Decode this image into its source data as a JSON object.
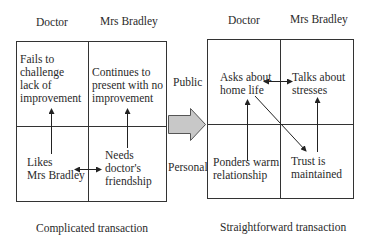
{
  "left_panel": {
    "headers": {
      "doctor": "Doctor",
      "patient": "Mrs Bradley"
    },
    "cells": {
      "public_doctor": [
        "Fails to",
        "challenge",
        "lack of",
        "improvement"
      ],
      "public_patient": [
        "Continues to",
        "present with no",
        "improvement"
      ],
      "personal_doctor": [
        "Likes",
        "Mrs Bradley"
      ],
      "personal_patient": [
        "Needs",
        "doctor's",
        "friendship"
      ]
    },
    "caption": "Complicated transaction"
  },
  "row_labels": {
    "public": "Public",
    "personal": "Personal"
  },
  "right_panel": {
    "headers": {
      "doctor": "Doctor",
      "patient": "Mrs Bradley"
    },
    "cells": {
      "public_doctor": [
        "Asks about",
        "home life"
      ],
      "public_patient": [
        "Talks about",
        "stresses"
      ],
      "personal_doctor": [
        "Ponders warm",
        "relationship"
      ],
      "personal_patient": [
        "Trust is",
        "maintained"
      ]
    },
    "caption": "Straightforward transaction"
  },
  "transition_arrow": {
    "icon": "block-arrow-right",
    "fill": "#c8c8c8",
    "stroke": "#555555"
  }
}
